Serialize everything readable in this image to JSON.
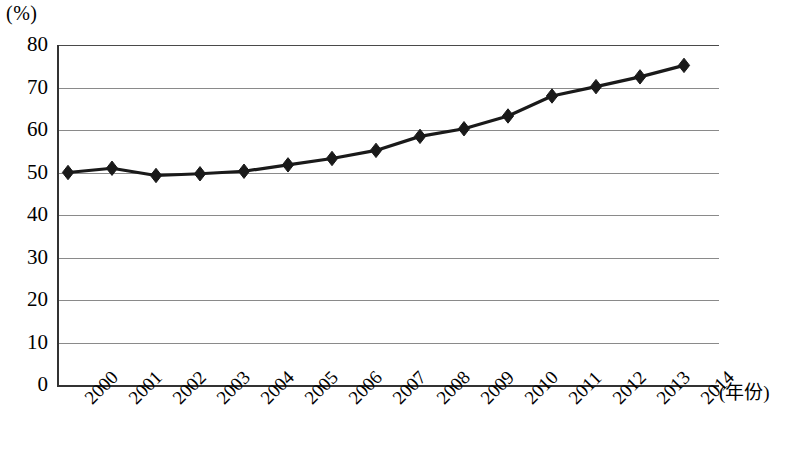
{
  "chart_data": {
    "type": "line",
    "title": "",
    "subtitle": "",
    "xlabel": "(年份)",
    "ylabel": "(%)",
    "categories": [
      "2000",
      "2001",
      "2002",
      "2003",
      "2004",
      "2005",
      "2006",
      "2007",
      "2008",
      "2009",
      "2010",
      "2011",
      "2012",
      "2013",
      "2014"
    ],
    "x": [
      2000,
      2001,
      2002,
      2003,
      2004,
      2005,
      2006,
      2007,
      2008,
      2009,
      2010,
      2011,
      2012,
      2013,
      2014
    ],
    "values": [
      50.0,
      51.0,
      49.3,
      49.7,
      50.3,
      51.8,
      53.3,
      55.2,
      58.5,
      60.3,
      63.3,
      68.0,
      70.2,
      72.5,
      75.2
    ],
    "series": [
      {
        "name": "",
        "values": [
          50.0,
          51.0,
          49.3,
          49.7,
          50.3,
          51.8,
          53.3,
          55.2,
          58.5,
          60.3,
          63.3,
          68.0,
          70.2,
          72.5,
          75.2
        ]
      }
    ],
    "ylim": [
      0,
      80
    ],
    "yticks": [
      0,
      10,
      20,
      30,
      40,
      50,
      60,
      70,
      80
    ],
    "ytick_labels": [
      "0",
      "10",
      "20",
      "30",
      "40",
      "50",
      "60",
      "70",
      "80"
    ],
    "grid": true,
    "grid_axis": "y",
    "legend": false,
    "legend_position": "none",
    "marker": "diamond",
    "line_color": "#1a1a1a",
    "marker_color": "#1a1a1a",
    "grid_color": "#8a8a8a",
    "axis_color": "#333333",
    "background_color": "#ffffff",
    "annotations": []
  }
}
